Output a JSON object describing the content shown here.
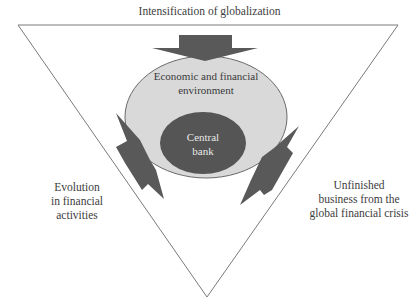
{
  "diagram": {
    "title": "Intensification of globalization",
    "outer_ellipse_label": "Economic and financial environment",
    "outer_ellipse_lines": [
      "Economic and financial",
      "environment"
    ],
    "inner_ellipse_label": "Central bank",
    "inner_ellipse_lines": [
      "Central",
      "bank"
    ],
    "left_label_lines": [
      "Evolution",
      "in financial",
      "activities"
    ],
    "right_label_lines": [
      "Unfinished",
      "business from the",
      "global financial crisis"
    ],
    "arrows": [
      {
        "from": "Intensification of globalization",
        "to": "Economic and financial environment",
        "shape": "block-arrow-down"
      },
      {
        "from": "Evolution in financial activities",
        "to": "Economic and financial environment",
        "shape": "lightning-bolt"
      },
      {
        "from": "Unfinished business from the global financial crisis",
        "to": "Economic and financial environment",
        "shape": "lightning-bolt"
      }
    ],
    "colors": {
      "triangle_stroke": "#7a7a7a",
      "outer_ellipse_fill": "#d9d9d9",
      "inner_ellipse_fill": "#555555",
      "arrow_fill": "#595959",
      "inner_text": "#e8e8e8"
    }
  }
}
